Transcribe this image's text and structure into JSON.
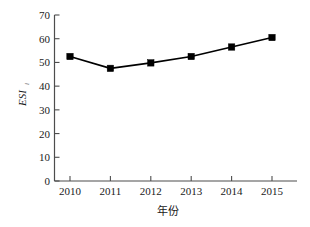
{
  "chart_data": {
    "type": "line",
    "title": "",
    "xlabel": "年份",
    "ylabel": "ESI",
    "ylabel_subscript": "i",
    "categories": [
      "2010",
      "2011",
      "2012",
      "2013",
      "2014",
      "2015"
    ],
    "x": [
      2010,
      2011,
      2012,
      2013,
      2014,
      2015
    ],
    "values": [
      52.5,
      47.5,
      49.8,
      52.5,
      56.5,
      60.5
    ],
    "series": [
      {
        "name": "ESI",
        "values": [
          52.5,
          47.5,
          49.8,
          52.5,
          56.5,
          60.5
        ],
        "marker": "square",
        "marker_color": "#000000",
        "line_color": "#000000"
      }
    ],
    "ylim": [
      0,
      70
    ],
    "yticks": [
      0,
      10,
      20,
      30,
      40,
      50,
      60,
      70
    ],
    "ytick_labels": [
      "0",
      "10",
      "20",
      "30",
      "40",
      "50",
      "60",
      "70"
    ],
    "xtick_labels": [
      "2010",
      "2011",
      "2012",
      "2013",
      "2014",
      "2015"
    ],
    "grid": false,
    "legend": false,
    "legend_position": "none",
    "background_color": "#ffffff",
    "axis_color": "#4d4d4d"
  }
}
